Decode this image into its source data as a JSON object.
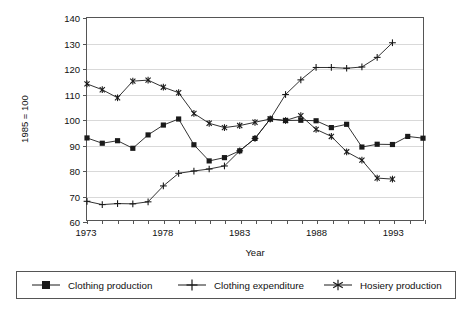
{
  "chart_data": {
    "type": "line",
    "title": "",
    "xlabel": "Year",
    "ylabel": "1985 = 100",
    "xlim": [
      1973,
      1995
    ],
    "ylim": [
      60,
      140
    ],
    "ytick_values": [
      60,
      70,
      80,
      90,
      100,
      110,
      120,
      130,
      140
    ],
    "xtick_values": [
      1973,
      1974,
      1975,
      1976,
      1977,
      1978,
      1979,
      1980,
      1981,
      1982,
      1983,
      1984,
      1985,
      1986,
      1987,
      1988,
      1989,
      1990,
      1991,
      1992,
      1993,
      1994,
      1995
    ],
    "xtick_labels_shown": [
      "1973",
      "1978",
      "1983",
      "1988",
      "1993"
    ],
    "grid": "horizontal",
    "legend_position": "bottom",
    "x": [
      1973,
      1974,
      1975,
      1976,
      1977,
      1978,
      1979,
      1980,
      1981,
      1982,
      1983,
      1984,
      1985,
      1986,
      1987,
      1988,
      1989,
      1990,
      1991,
      1992,
      1993,
      1994,
      1995
    ],
    "series": [
      {
        "name": "Clothing production",
        "marker": "square",
        "color": "#1a1a1a",
        "values": [
          92.5,
          90.4,
          91.4,
          88.4,
          93.7,
          97.6,
          100.0,
          89.8,
          83.4,
          84.7,
          87.4,
          92.3,
          100.0,
          99.4,
          99.5,
          99.3,
          96.6,
          97.9,
          88.9,
          90.0,
          89.9,
          93.1,
          92.4
        ]
      },
      {
        "name": "Clothing expenditure",
        "marker": "plus",
        "color": "#1a1a1a",
        "values": [
          67.4,
          66.1,
          66.5,
          66.4,
          67.2,
          73.5,
          78.5,
          79.4,
          80.2,
          81.4,
          87.4,
          92.3,
          100.0,
          109.7,
          115.5,
          120.4,
          120.4,
          120.1,
          120.6,
          124.4,
          130.2,
          null,
          null
        ]
      },
      {
        "name": "Hosiery production",
        "marker": "asterisk",
        "color": "#1a1a1a",
        "values": [
          113.9,
          111.6,
          108.4,
          115.0,
          115.4,
          112.6,
          110.4,
          102.2,
          98.3,
          96.6,
          97.4,
          98.7,
          100.0,
          99.4,
          101.3,
          95.9,
          93.1,
          87.0,
          83.7,
          76.6,
          76.2,
          null,
          null
        ]
      }
    ]
  },
  "legend": {
    "items": [
      {
        "label": "Clothing production",
        "marker": "square-marker"
      },
      {
        "label": "Clothing expenditure",
        "marker": "plus-marker"
      },
      {
        "label": "Hosiery production",
        "marker": "asterisk-marker"
      }
    ]
  }
}
